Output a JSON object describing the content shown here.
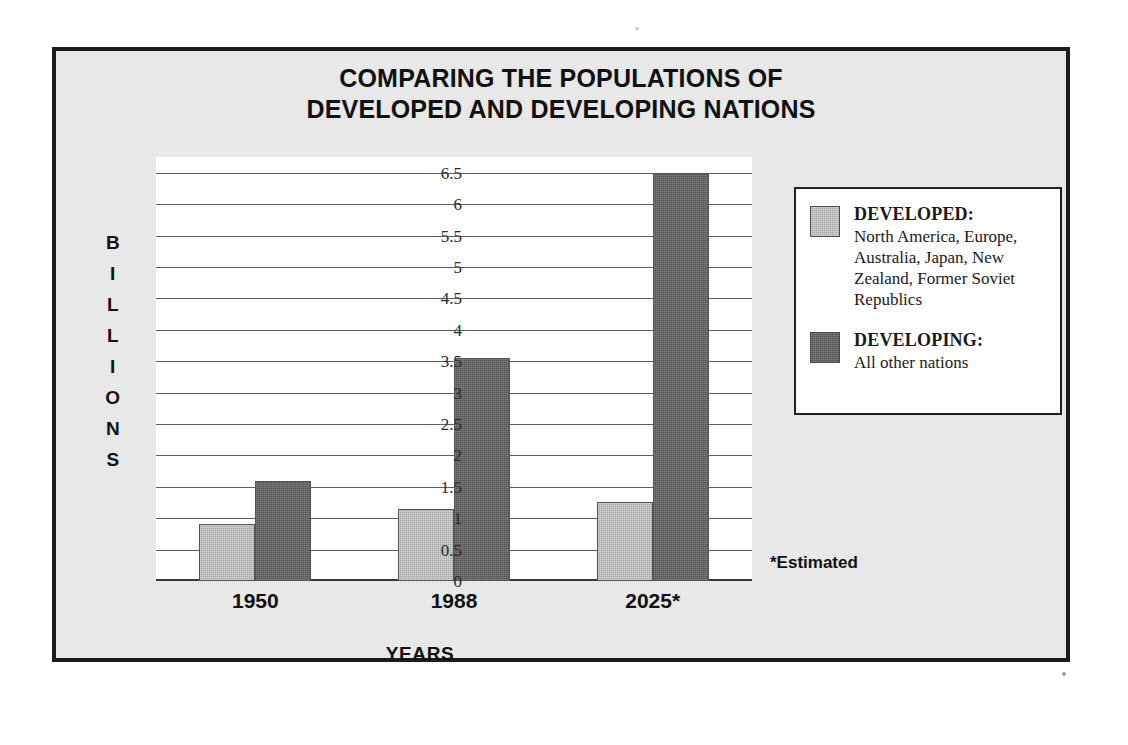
{
  "poster": {
    "title_line1": "COMPARING THE POPULATIONS OF",
    "title_line2": "DEVELOPED AND DEVELOPING NATIONS",
    "estimated_note": "*Estimated",
    "frame_color": "#1c1c1c",
    "background_color": "#ededed"
  },
  "axis": {
    "y_title_letters": [
      "B",
      "I",
      "L",
      "L",
      "I",
      "O",
      "N",
      "S"
    ],
    "y_title": "BILLIONS",
    "x_title": "YEARS"
  },
  "legend": {
    "entries": [
      {
        "head": "DEVELOPED:",
        "desc": "North America, Europe, Australia, Japan, New Zealand, Former Soviet Republics",
        "color": "#a8a8a8"
      },
      {
        "head": "DEVELOPING:",
        "desc": "All other nations",
        "color": "#545454"
      }
    ]
  },
  "chart_data": {
    "type": "bar",
    "title": "COMPARING THE POPULATIONS OF DEVELOPED AND DEVELOPING NATIONS",
    "xlabel": "YEARS",
    "ylabel": "BILLIONS",
    "categories": [
      "1950",
      "1988",
      "2025*"
    ],
    "series": [
      {
        "name": "DEVELOPED:",
        "values": [
          0.9,
          1.15,
          1.25
        ],
        "color": "#a8a8a8"
      },
      {
        "name": "DEVELOPING:",
        "values": [
          1.6,
          3.55,
          6.5
        ],
        "color": "#545454"
      }
    ],
    "ylim": [
      0,
      6.75
    ],
    "yticks": [
      0,
      0.5,
      1,
      1.5,
      2,
      2.5,
      3,
      3.5,
      4,
      4.5,
      5,
      5.5,
      6,
      6.5
    ],
    "ytick_labels": [
      "0",
      "0.5",
      "1",
      "1.5",
      "2",
      "2.5",
      "3",
      "3.5",
      "4",
      "4.5",
      "5",
      "5.5",
      "6",
      "6.5"
    ],
    "grid": true,
    "legend_position": "right",
    "annotations": [
      "*Estimated"
    ]
  },
  "scan": {
    "speck_glyph": "′′"
  }
}
